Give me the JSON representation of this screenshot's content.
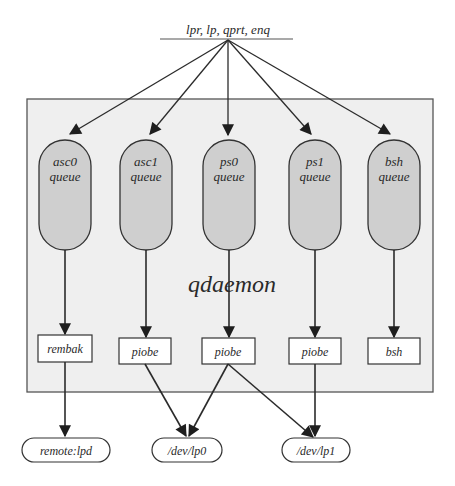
{
  "diagram": {
    "type": "flowchart",
    "title_command": "lpr, lp, qprt, enq",
    "daemon_label": "qdaemon",
    "colors": {
      "frame_fill": "#efefef",
      "frame_stroke": "#555555",
      "queue_fill": "#cfcfcf",
      "stroke": "#2b2b2b"
    },
    "queues": [
      {
        "id": "asc0",
        "line1": "asc0",
        "line2": "queue"
      },
      {
        "id": "asc1",
        "line1": "asc1",
        "line2": "queue"
      },
      {
        "id": "ps0",
        "line1": "ps0",
        "line2": "queue"
      },
      {
        "id": "ps1",
        "line1": "ps1",
        "line2": "queue"
      },
      {
        "id": "bsh",
        "line1": "bsh",
        "line2": "queue"
      }
    ],
    "backends": [
      {
        "id": "rembak",
        "label": "rembak"
      },
      {
        "id": "piobe1",
        "label": "piobe"
      },
      {
        "id": "piobe2",
        "label": "piobe"
      },
      {
        "id": "piobe3",
        "label": "piobe"
      },
      {
        "id": "bsh",
        "label": "bsh"
      }
    ],
    "devices": [
      {
        "id": "remote",
        "label": "remote:lpd"
      },
      {
        "id": "lp0",
        "label": "/dev/lp0"
      },
      {
        "id": "lp1",
        "label": "/dev/lp1"
      }
    ],
    "edges": [
      {
        "from": "command",
        "to": "asc0 queue"
      },
      {
        "from": "command",
        "to": "asc1 queue"
      },
      {
        "from": "command",
        "to": "ps0 queue"
      },
      {
        "from": "command",
        "to": "ps1 queue"
      },
      {
        "from": "command",
        "to": "bsh queue"
      },
      {
        "from": "asc0 queue",
        "to": "rembak"
      },
      {
        "from": "asc1 queue",
        "to": "piobe1"
      },
      {
        "from": "ps0 queue",
        "to": "piobe2"
      },
      {
        "from": "ps1 queue",
        "to": "piobe3"
      },
      {
        "from": "bsh queue",
        "to": "bsh"
      },
      {
        "from": "rembak",
        "to": "remote:lpd"
      },
      {
        "from": "piobe1",
        "to": "/dev/lp0"
      },
      {
        "from": "piobe2",
        "to": "/dev/lp0"
      },
      {
        "from": "piobe2",
        "to": "/dev/lp1"
      },
      {
        "from": "piobe3",
        "to": "/dev/lp1"
      }
    ]
  }
}
